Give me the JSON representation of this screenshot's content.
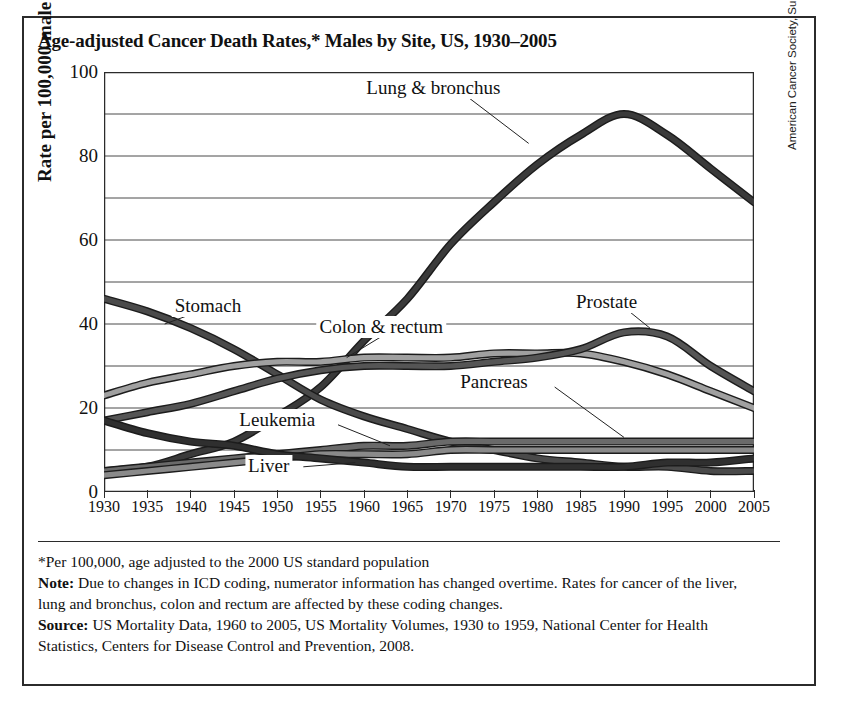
{
  "title": "Age-adjusted Cancer Death Rates,* Males by Site, US, 1930–2005",
  "credit": "American Cancer Society, Surveillance and Health Policy Research, 2009",
  "notes": {
    "footnote": "*Per 100,000, age adjusted to the 2000 US standard population",
    "note_label": "Note:",
    "note_text": " Due to changes in ICD coding, numerator information has changed overtime. Rates for cancer of the liver, lung and bronchus, colon and rectum are affected by these coding changes.",
    "source_label": "Source:",
    "source_text": " US Mortality Data, 1960 to 2005, US Mortality Volumes, 1930 to 1959, National Center for Health Statistics, Centers for Disease Control and Prevention, 2008."
  },
  "chart_data": {
    "type": "line",
    "title": "Age-adjusted Cancer Death Rates,* Males by Site, US, 1930–2005",
    "xlabel": "",
    "ylabel": "Rate per 100,000 male population",
    "xlim": [
      1930,
      2005
    ],
    "ylim": [
      0,
      100
    ],
    "yticks": [
      0,
      20,
      40,
      60,
      80,
      100
    ],
    "ygridlines": [
      0,
      10,
      20,
      30,
      40,
      50,
      60,
      70,
      80,
      90,
      100
    ],
    "xticks": [
      1930,
      1935,
      1940,
      1945,
      1950,
      1955,
      1960,
      1965,
      1970,
      1975,
      1980,
      1985,
      1990,
      1995,
      2000,
      2005
    ],
    "grid": true,
    "legend": "inline-labels",
    "x": [
      1930,
      1935,
      1940,
      1945,
      1950,
      1955,
      1960,
      1965,
      1970,
      1975,
      1980,
      1985,
      1990,
      1995,
      2000,
      2005
    ],
    "series": [
      {
        "name": "Lung & bronchus",
        "color": "#3a3a3a",
        "label_x": 1968,
        "label_y": 96,
        "values": [
          5,
          6,
          9,
          12,
          18,
          25,
          36,
          46,
          59,
          69,
          78,
          85,
          90,
          85,
          77,
          69
        ]
      },
      {
        "name": "Stomach",
        "color": "#4a4a4a",
        "label_x": 1942,
        "label_y": 44,
        "values": [
          46,
          43,
          39,
          34,
          28,
          22,
          18,
          15,
          12,
          10,
          8,
          7,
          6,
          6,
          5,
          5
        ]
      },
      {
        "name": "Colon & rectum",
        "color": "#a0a0a0",
        "label_x": 1962,
        "label_y": 39,
        "values": [
          23,
          26,
          28,
          30,
          31,
          31,
          32,
          32,
          32,
          33,
          33,
          33,
          31,
          28,
          24,
          20
        ]
      },
      {
        "name": "Prostate",
        "color": "#555555",
        "label_x": 1988,
        "label_y": 45,
        "values": [
          17,
          19,
          21,
          24,
          27,
          29,
          30,
          30,
          30,
          31,
          32,
          34,
          38,
          37,
          30,
          24
        ]
      },
      {
        "name": "Pancreas",
        "color": "#6a6a6a",
        "label_x": 1975,
        "label_y": 26,
        "values": [
          5,
          6,
          7,
          8,
          9,
          10,
          11,
          11,
          12,
          12,
          12,
          12,
          12,
          12,
          12,
          12
        ]
      },
      {
        "name": "Leukemia",
        "color": "#8a8a8a",
        "label_x": 1950,
        "label_y": 17,
        "values": [
          4,
          5,
          6,
          7,
          8,
          9,
          9,
          9,
          10,
          10,
          10,
          10,
          10,
          10,
          10,
          10
        ]
      },
      {
        "name": "Liver",
        "color": "#2f2f2f",
        "label_x": 1949,
        "label_y": 6,
        "values": [
          17,
          14,
          12,
          11,
          9,
          8,
          7,
          6,
          6,
          6,
          6,
          6,
          6,
          7,
          7,
          8
        ]
      }
    ],
    "annotations": [
      {
        "text": "Lung & bronchus",
        "leader_from_x": 1972,
        "leader_from_y": 94,
        "leader_to_x": 1979,
        "leader_to_y": 83
      },
      {
        "text": "Stomach",
        "leader_from_x": 1941,
        "leader_from_y": 43,
        "leader_to_x": 1937,
        "leader_to_y": 40
      },
      {
        "text": "Colon & rectum",
        "leader_from_x": 1962,
        "leader_from_y": 37,
        "leader_to_x": 1958,
        "leader_to_y": 32
      },
      {
        "text": "Prostate",
        "leader_from_x": 1990,
        "leader_from_y": 44,
        "leader_to_x": 1993,
        "leader_to_y": 39
      },
      {
        "text": "Pancreas",
        "leader_from_x": 1982,
        "leader_from_y": 25,
        "leader_to_x": 1990,
        "leader_to_y": 13
      },
      {
        "text": "Leukemia",
        "leader_from_x": 1957,
        "leader_from_y": 16,
        "leader_to_x": 1963,
        "leader_to_y": 11
      },
      {
        "text": "Liver",
        "leader_from_x": 1953,
        "leader_from_y": 6,
        "leader_to_x": 1959,
        "leader_to_y": 7
      }
    ]
  }
}
